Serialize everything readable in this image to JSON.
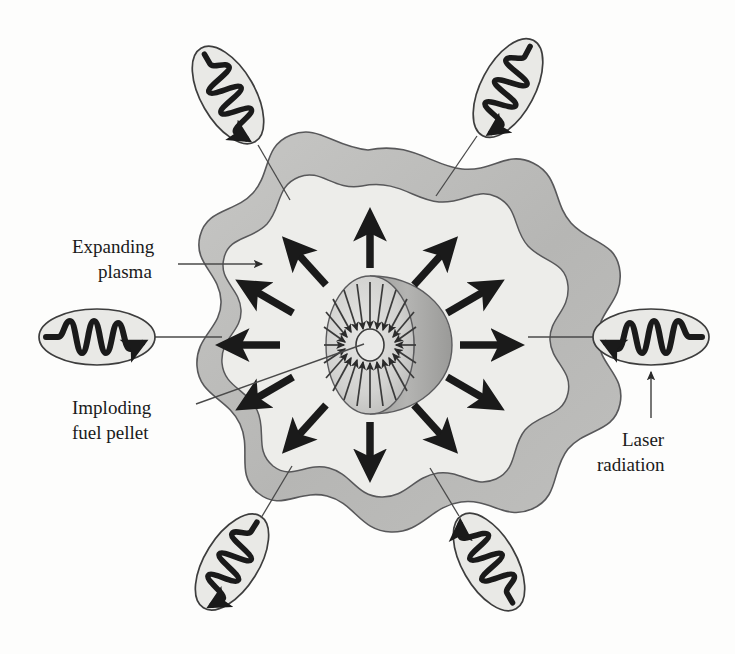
{
  "figure": {
    "background_color": "#fdfdfc",
    "ink_color": "#1a1a1a",
    "outer_plasma_color": "#b9b9b7",
    "inner_plasma_color": "#ededea",
    "pellet_face_color": "#d6d6d4",
    "pellet_shell_color": "#a8a8a6",
    "beam_ellipse_color": "#e9e9e6"
  },
  "labels": [
    {
      "id": "expanding-plasma",
      "line1": "Expanding",
      "line2": "plasma",
      "x": 70,
      "y": 247,
      "leader": "horizontal-arrow-right"
    },
    {
      "id": "imploding-fuel-pellet",
      "line1": "Imploding",
      "line2": "fuel pellet",
      "x": 70,
      "y": 410,
      "leader": "diagonal-line-up-right"
    },
    {
      "id": "laser-radiation",
      "line1": "Laser",
      "line2": "radiation",
      "x": 622,
      "y": 438,
      "leader": "vertical-arrow-up"
    }
  ],
  "laser_beams": [
    {
      "id": "beam-left",
      "cx": 97,
      "cy": 337,
      "rx": 58,
      "ry": 28,
      "rotate": 0,
      "direction": "right"
    },
    {
      "id": "beam-right",
      "cx": 651,
      "cy": 337,
      "rx": 58,
      "ry": 28,
      "rotate": 0,
      "direction": "left"
    },
    {
      "id": "beam-top-left",
      "cx": 228,
      "cy": 95,
      "rx": 52,
      "ry": 27,
      "rotate": 60,
      "direction": "right"
    },
    {
      "id": "beam-top-right",
      "cx": 508,
      "cy": 88,
      "rx": 52,
      "ry": 27,
      "rotate": -62,
      "direction": "left"
    },
    {
      "id": "beam-bottom-left",
      "cx": 232,
      "cy": 562,
      "rx": 52,
      "ry": 27,
      "rotate": -58,
      "direction": "left"
    },
    {
      "id": "beam-bottom-right",
      "cx": 489,
      "cy": 562,
      "rx": 52,
      "ry": 27,
      "rotate": 60,
      "direction": "left"
    }
  ],
  "expansion_arrows": {
    "count": 12,
    "description": "thick black arrows radiating outward from the fuel pellet through the plasma",
    "angles_deg": [
      90,
      60,
      30,
      0,
      -30,
      -60,
      -90,
      -120,
      -150,
      180,
      150,
      120
    ]
  },
  "implosion_arrows": {
    "count": 20,
    "description": "thin arrows converging inward on the pellet core"
  },
  "core": {
    "cx": 370,
    "cy": 345,
    "rx": 14,
    "ry": 16
  }
}
